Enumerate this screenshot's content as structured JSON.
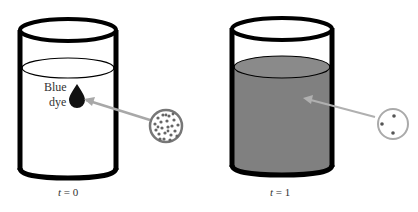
{
  "diagram": {
    "left_beaker": {
      "label_line1": "Blue",
      "label_line2": "dye",
      "time_var": "t",
      "time_eq": " = 0"
    },
    "right_beaker": {
      "time_var": "t",
      "time_eq": " = 1"
    },
    "colors": {
      "outline": "#000000",
      "liquid_mixed": "#808080",
      "arrow": "#a8a8a8",
      "particles_dense": "#666666"
    }
  }
}
